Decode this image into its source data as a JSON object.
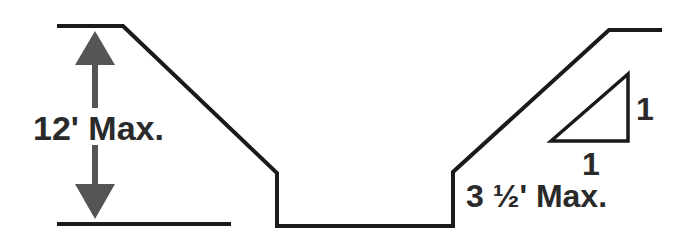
{
  "diagram": {
    "labels": {
      "max_depth": "12' Max.",
      "max_vertical_wall": "3 ½' Max.",
      "slope_rise": "1",
      "slope_run": "1"
    },
    "colors": {
      "line": "#1a1a1a",
      "arrow": "#555555",
      "text": "#2a2a2a"
    }
  }
}
